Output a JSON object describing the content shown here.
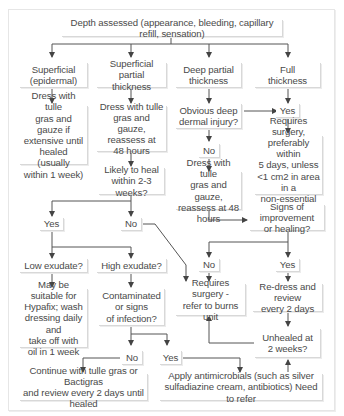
{
  "diagram": {
    "root": "Depth assessed (appearance, bleeding, capillary refill, sensation)",
    "columns": [
      {
        "label": "Superficial\n(epidermal)"
      },
      {
        "label": "Superficial\npartial thickness"
      },
      {
        "label": "Deep partial\nthickness"
      },
      {
        "label": "Full\nthickness"
      }
    ],
    "nodes": {
      "superficial_action": "Dress with tulle\ngras and gauze if\nextensive until\nhealed (usually\nwithin 1 week)",
      "spt_action": "Dress with tulle\ngras and gauze,\nreassess at\n48 hours",
      "spt_question": "Likely to heal\nwithin 2-3 weeks?",
      "spt_yes": "Yes",
      "spt_no": "No",
      "low_exudate": "Low exudate?",
      "high_exudate": "High exudate?",
      "low_action": "May be suitable for\nHypafix; wash\ndressing daily and\ntake off with\noil in 1 week",
      "contaminated": "Contaminated\nor signs\nof infection?",
      "contam_no": "No",
      "contam_yes": "Yes",
      "continue_tulle": "Continue with tulle gras or Bactigras\nand review every 2 days until healed",
      "antimicrobials": "Apply antimicrobials (such as silver\nsulfadiazine cream, antibiotics) Need to refer",
      "dp_question": "Obvious deep\ndermal injury?",
      "dp_no": "No",
      "dp_action": "Dress with tulle\ngras and gauze,\nreassess at 48 hours",
      "ft_yes": "Yes",
      "ft_surgery": "Requires surgery,\npreferably within\n5 days, unless\n<1 cm2 in area in a\nnon-essential area",
      "signs_question": "Signs of improvement\nor healing?",
      "signs_no": "No",
      "signs_yes": "Yes",
      "refer_burns": "Requires surgery -\nrefer to burns unit",
      "redress": "Re-dress and review\nevery 2 days",
      "unhealed": "Unhealed at\n2 weeks?"
    }
  }
}
